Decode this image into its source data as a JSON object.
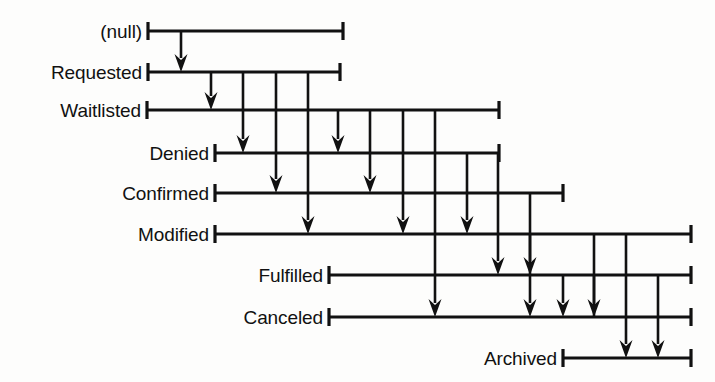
{
  "diagram": {
    "type": "state-transition-lifeline-diagram",
    "background_color": "#fdfdfc",
    "line_color": "#111111",
    "states": [
      {
        "id": "null",
        "label": "(null)",
        "order": 0,
        "y": 31,
        "line_start_x": 148,
        "line_end_x": 343,
        "label_right_x": 142
      },
      {
        "id": "requested",
        "label": "Requested",
        "order": 1,
        "y": 72,
        "line_start_x": 148,
        "line_end_x": 340,
        "label_right_x": 142
      },
      {
        "id": "waitlisted",
        "label": "Waitlisted",
        "order": 2,
        "y": 110,
        "line_start_x": 147,
        "line_end_x": 499,
        "label_right_x": 141
      },
      {
        "id": "denied",
        "label": "Denied",
        "order": 3,
        "y": 153,
        "line_start_x": 215,
        "line_end_x": 499,
        "label_right_x": 209
      },
      {
        "id": "confirmed",
        "label": "Confirmed",
        "order": 4,
        "y": 193,
        "line_start_x": 215,
        "line_end_x": 563,
        "label_right_x": 209
      },
      {
        "id": "modified",
        "label": "Modified",
        "order": 5,
        "y": 234,
        "line_start_x": 215,
        "line_end_x": 691,
        "label_right_x": 209
      },
      {
        "id": "fulfilled",
        "label": "Fulfilled",
        "order": 6,
        "y": 275,
        "line_start_x": 329,
        "line_end_x": 691,
        "label_right_x": 323
      },
      {
        "id": "canceled",
        "label": "Canceled",
        "order": 7,
        "y": 317,
        "line_start_x": 329,
        "line_end_x": 691,
        "label_right_x": 323
      },
      {
        "id": "archived",
        "label": "Archived",
        "order": 8,
        "y": 358,
        "line_start_x": 563,
        "line_end_x": 691,
        "label_right_x": 557
      }
    ],
    "transitions": [
      {
        "from": "null",
        "to": "requested",
        "x": 181
      },
      {
        "from": "requested",
        "to": "waitlisted",
        "x": 211
      },
      {
        "from": "requested",
        "to": "denied",
        "x": 243
      },
      {
        "from": "requested",
        "to": "confirmed",
        "x": 276
      },
      {
        "from": "requested",
        "to": "modified",
        "x": 308
      },
      {
        "from": "waitlisted",
        "to": "denied",
        "x": 338
      },
      {
        "from": "waitlisted",
        "to": "confirmed",
        "x": 370
      },
      {
        "from": "waitlisted",
        "to": "modified",
        "x": 403
      },
      {
        "from": "waitlisted",
        "to": "canceled",
        "x": 435
      },
      {
        "from": "denied",
        "to": "modified",
        "x": 467
      },
      {
        "from": "denied",
        "to": "fulfilled",
        "x": 498
      },
      {
        "from": "confirmed",
        "to": "fulfilled",
        "x": 530
      },
      {
        "from": "confirmed",
        "to": "canceled",
        "x": 530
      },
      {
        "from": "confirmed",
        "to": "archived",
        "x": 626
      },
      {
        "from": "modified",
        "to": "canceled",
        "x": 594
      },
      {
        "from": "modified",
        "to": "archived",
        "x": 658
      },
      {
        "from": "fulfilled",
        "to": "canceled",
        "x": 563
      }
    ],
    "segments": [
      {
        "name": "null-to-requested",
        "x": 181,
        "y_from": 31,
        "y_to": 72,
        "arrow": true
      },
      {
        "name": "requested-to-waitlisted",
        "x": 211,
        "y_from": 72,
        "y_to": 110,
        "arrow": true
      },
      {
        "name": "requested-to-denied",
        "x": 243,
        "y_from": 72,
        "y_to": 153,
        "arrow": true
      },
      {
        "name": "requested-to-confirmed",
        "x": 276,
        "y_from": 72,
        "y_to": 193,
        "arrow": true
      },
      {
        "name": "requested-to-modified",
        "x": 308,
        "y_from": 72,
        "y_to": 234,
        "arrow": true
      },
      {
        "name": "waitlisted-to-denied",
        "x": 338,
        "y_from": 110,
        "y_to": 153,
        "arrow": true
      },
      {
        "name": "waitlisted-to-confirmed",
        "x": 370,
        "y_from": 110,
        "y_to": 193,
        "arrow": true
      },
      {
        "name": "waitlisted-to-modified",
        "x": 403,
        "y_from": 110,
        "y_to": 234,
        "arrow": true
      },
      {
        "name": "waitlisted-to-canceled",
        "x": 435,
        "y_from": 110,
        "y_to": 317,
        "arrow": true
      },
      {
        "name": "denied-to-modified",
        "x": 467,
        "y_from": 153,
        "y_to": 234,
        "arrow": true
      },
      {
        "name": "denied-to-fulfilled",
        "x": 498,
        "y_from": 153,
        "y_to": 275,
        "arrow": true
      },
      {
        "name": "confirmed-to-fulfilled",
        "x": 530,
        "y_from": 193,
        "y_to": 275,
        "arrow": true
      },
      {
        "name": "fulfilled-to-canceled",
        "x": 563,
        "y_from": 275,
        "y_to": 317,
        "arrow": true
      },
      {
        "name": "confirmed-to-canceled",
        "x": 530,
        "y_from": 275,
        "y_to": 317,
        "arrow": true
      },
      {
        "name": "modified-to-canceled",
        "x": 594,
        "y_from": 234,
        "y_to": 317,
        "arrow": true
      },
      {
        "name": "canceled-to-archived",
        "x": 626,
        "y_from": 317,
        "y_to": 358,
        "arrow": true
      },
      {
        "name": "archived-inbound-right",
        "x": 658,
        "y_from": 317,
        "y_to": 358,
        "arrow": true
      }
    ],
    "extra_verticals": [
      {
        "name": "col-530-confirmed-span",
        "x": 530,
        "y_from": 234,
        "y_to": 275
      },
      {
        "name": "col-594-modified-span",
        "x": 594,
        "y_from": 275,
        "y_to": 317
      },
      {
        "name": "col-626-modified-span",
        "x": 626,
        "y_from": 234,
        "y_to": 317
      },
      {
        "name": "col-658-modified-span",
        "x": 658,
        "y_from": 275,
        "y_to": 317
      }
    ]
  }
}
